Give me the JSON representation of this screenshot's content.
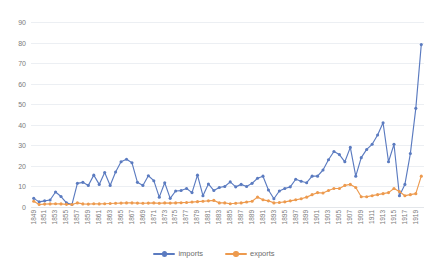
{
  "chart_data": {
    "type": "line",
    "title": "",
    "subtitle": "",
    "xlabel": "",
    "ylabel": "",
    "ylim": [
      0,
      90
    ],
    "yticks": [
      0,
      10,
      20,
      30,
      40,
      50,
      60,
      70,
      80,
      90
    ],
    "grid": true,
    "legend_position": "bottom",
    "markers": true,
    "x": [
      1849,
      1850,
      1851,
      1852,
      1853,
      1854,
      1855,
      1856,
      1857,
      1858,
      1859,
      1860,
      1861,
      1862,
      1863,
      1864,
      1865,
      1866,
      1867,
      1868,
      1869,
      1870,
      1871,
      1872,
      1873,
      1874,
      1875,
      1876,
      1877,
      1878,
      1879,
      1880,
      1881,
      1882,
      1883,
      1884,
      1885,
      1886,
      1887,
      1888,
      1889,
      1890,
      1891,
      1892,
      1893,
      1894,
      1895,
      1896,
      1897,
      1898,
      1899,
      1900,
      1901,
      1902,
      1903,
      1904,
      1905,
      1906,
      1907,
      1908,
      1909,
      1910,
      1911,
      1912,
      1913,
      1914,
      1915,
      1916,
      1917,
      1918,
      1919,
      1920
    ],
    "xtick_labels": [
      "1849",
      "1851",
      "1853",
      "1855",
      "1857",
      "1859",
      "1861",
      "1863",
      "1865",
      "1867",
      "1869",
      "1871",
      "1873",
      "1875",
      "1877",
      "1879",
      "1881",
      "1883",
      "1885",
      "1887",
      "1889",
      "1891",
      "1893",
      "1895",
      "1897",
      "1899",
      "1901",
      "1903",
      "1905",
      "1907",
      "1909",
      "1911",
      "1913",
      "1915",
      "1917",
      "1919"
    ],
    "series": [
      {
        "name": "imports",
        "color": "#5b7bc0",
        "values": [
          4.2,
          2.5,
          3.0,
          3.4,
          7.3,
          5.1,
          2.0,
          1.2,
          11.5,
          12.0,
          10.5,
          15.5,
          11.0,
          16.8,
          10.5,
          17.0,
          22.0,
          23.2,
          21.5,
          12.0,
          10.5,
          15.2,
          12.8,
          4.8,
          11.8,
          4.2,
          7.8,
          8.0,
          9.0,
          7.0,
          15.5,
          5.5,
          11.2,
          8.0,
          9.5,
          10.0,
          12.2,
          9.8,
          11.0,
          10.0,
          11.5,
          14.0,
          15.0,
          8.3,
          4.0,
          7.8,
          9.0,
          9.8,
          13.5,
          12.5,
          11.8,
          15.0,
          15.0,
          18.0,
          23.0,
          27.0,
          25.5,
          22.0,
          29.0,
          15.0,
          24.0,
          28.0,
          30.5,
          35.0,
          41.0,
          22.0,
          30.5,
          5.5,
          11.0,
          26.0,
          48.0,
          79.0
        ]
      },
      {
        "name": "exports",
        "color": "#ed9a4e",
        "values": [
          2.8,
          1.2,
          1.4,
          1.5,
          1.6,
          1.5,
          1.3,
          1.2,
          2.0,
          1.5,
          1.4,
          1.6,
          1.5,
          1.6,
          1.7,
          1.8,
          1.9,
          2.0,
          2.0,
          1.9,
          1.8,
          1.9,
          2.0,
          1.8,
          2.0,
          1.9,
          2.0,
          2.1,
          2.2,
          2.4,
          2.6,
          2.8,
          3.0,
          3.2,
          2.0,
          2.0,
          1.6,
          1.8,
          2.0,
          2.4,
          2.8,
          4.8,
          3.5,
          3.0,
          2.0,
          2.2,
          2.5,
          3.0,
          3.5,
          4.0,
          4.8,
          6.0,
          7.0,
          6.8,
          8.0,
          9.0,
          9.0,
          10.5,
          11.0,
          9.5,
          5.0,
          5.0,
          5.5,
          6.0,
          6.5,
          7.0,
          9.0,
          7.5,
          5.5,
          6.0,
          6.5,
          15.0
        ]
      }
    ]
  },
  "legend": {
    "items": [
      {
        "label": "imports",
        "color": "#5b7bc0"
      },
      {
        "label": "exports",
        "color": "#ed9a4e"
      }
    ]
  },
  "colors": {
    "imports": "#5b7bc0",
    "exports": "#ed9a4e",
    "gridline": "#eceff3",
    "axis_text": "#7b7b7b",
    "background": "#ffffff"
  }
}
